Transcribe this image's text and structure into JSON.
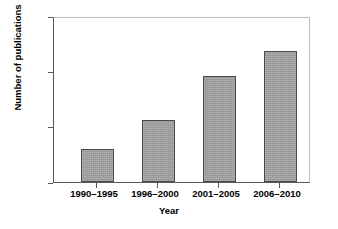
{
  "chart_data": {
    "type": "bar",
    "title": "",
    "categories": [
      "1990–1995",
      "1996–2000",
      "2001–2005",
      "2006–2010"
    ],
    "values": [
      30,
      57,
      97,
      120
    ],
    "series": [
      {
        "name": "Number of publications",
        "values": [
          30,
          57,
          97,
          120
        ]
      }
    ],
    "xlabel": "Year",
    "ylabel": "Number of publications",
    "ylim": [
      0,
      150
    ],
    "yticks": [
      0,
      50,
      100,
      150
    ],
    "ytick_labels": [
      "0",
      "50",
      "100",
      "150"
    ],
    "grid": false,
    "legend": false,
    "bar_color": "#a3a3a3",
    "bar_edge_color": "#4a4a4a",
    "axis_color": "#58585a",
    "frame_color": "#bdbdbd",
    "background": "#ffffff"
  }
}
